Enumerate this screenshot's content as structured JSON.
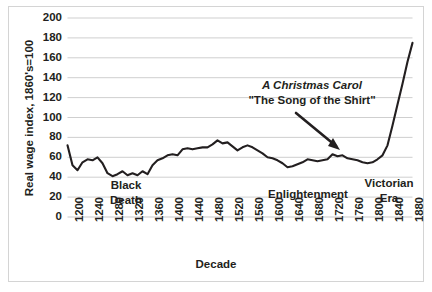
{
  "chart_data": {
    "type": "line",
    "title": "",
    "xlabel": "Decade",
    "ylabel": "Real wage index, 1860's=100",
    "ylim": [
      0,
      200
    ],
    "ytick_step": 20,
    "yticks": [
      "200",
      "180",
      "160",
      "140",
      "120",
      "100",
      "80",
      "60",
      "40",
      "20",
      "0"
    ],
    "xticks": [
      "1200",
      "1240",
      "1280",
      "1320",
      "1360",
      "1400",
      "1440",
      "1480",
      "1520",
      "1560",
      "1600",
      "1640",
      "1680",
      "1720",
      "1760",
      "1800",
      "1840",
      "1880"
    ],
    "xlim": [
      1200,
      1890
    ],
    "grid": "horizontal",
    "legend": "none",
    "line_color": "#231f20",
    "gridline_color": "#c9c9c9",
    "series": [
      {
        "name": "Real wage index",
        "x": [
          1200,
          1210,
          1220,
          1230,
          1240,
          1250,
          1260,
          1270,
          1280,
          1290,
          1300,
          1310,
          1320,
          1330,
          1340,
          1350,
          1360,
          1370,
          1380,
          1390,
          1400,
          1410,
          1420,
          1430,
          1440,
          1450,
          1460,
          1470,
          1480,
          1490,
          1500,
          1510,
          1520,
          1530,
          1540,
          1550,
          1560,
          1570,
          1580,
          1590,
          1600,
          1610,
          1620,
          1630,
          1640,
          1650,
          1660,
          1670,
          1680,
          1690,
          1700,
          1710,
          1720,
          1730,
          1740,
          1750,
          1760,
          1770,
          1780,
          1790,
          1800,
          1810,
          1820,
          1830,
          1840,
          1850,
          1860,
          1870,
          1880,
          1890
        ],
        "values": [
          72,
          52,
          47,
          55,
          58,
          57,
          60,
          54,
          44,
          41,
          43,
          46,
          42,
          44,
          42,
          46,
          43,
          52,
          57,
          59,
          62,
          63,
          62,
          68,
          69,
          68,
          69,
          70,
          70,
          73,
          77,
          74,
          75,
          71,
          67,
          70,
          72,
          70,
          67,
          64,
          60,
          59,
          57,
          54,
          50,
          51,
          53,
          55,
          58,
          57,
          56,
          57,
          58,
          63,
          61,
          62,
          59,
          58,
          57,
          55,
          54,
          55,
          58,
          62,
          72,
          92,
          113,
          134,
          156,
          175
        ]
      }
    ],
    "annotations": [
      {
        "name": "black-death",
        "text": "Black\nDeath",
        "line1": "Black",
        "line2": "Death"
      },
      {
        "name": "enlightenment",
        "text": "Enlightenment"
      },
      {
        "name": "victorian-era",
        "line1": "Victorian",
        "line2": "Era"
      },
      {
        "name": "callout",
        "line1": "A Christmas Carol",
        "line2": "\"The Song of the Shirt\"",
        "has_arrow": true
      }
    ]
  },
  "axis": {
    "ylabel": "Real wage index, 1860's=100",
    "xlabel": "Decade"
  },
  "labels": {
    "black_death_line1": "Black",
    "black_death_line2": "Death",
    "enlightenment": "Enlightenment",
    "victorian_line1": "Victorian",
    "victorian_line2": "Era",
    "callout_line1": "A Christmas Carol",
    "callout_line2": "\"The Song of the Shirt\""
  }
}
